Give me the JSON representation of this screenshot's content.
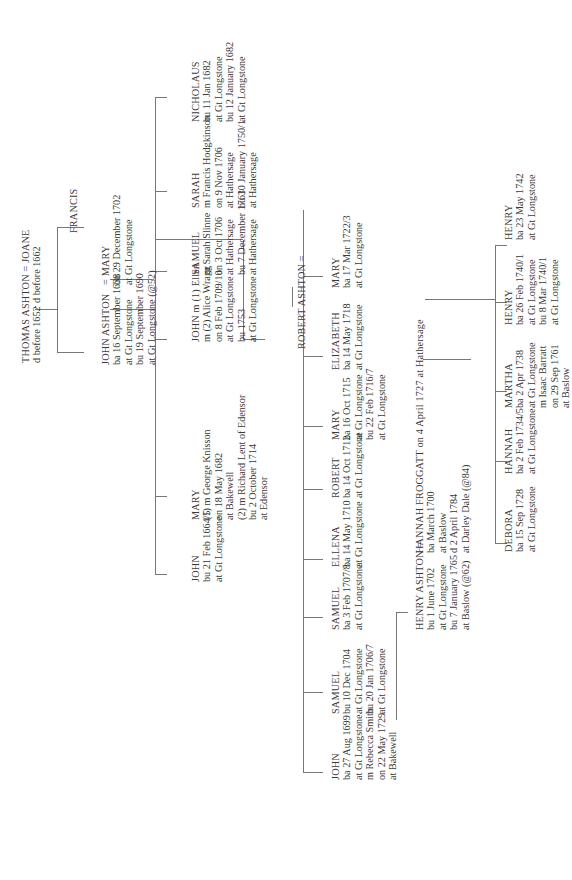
{
  "tree": {
    "gen1": {
      "couple": "THOMAS ASHTON = JOANE",
      "husband_details": [
        "d before 1652"
      ],
      "wife_details": [
        "d before 1662"
      ]
    },
    "gen2": [
      {
        "id": "john-ashton",
        "name": "JOHN ASHTON",
        "details": [
          "ba 16 September 1638",
          "at Gt Longstone",
          "bu 19 September 1690",
          "at Gt Longstone (@52)"
        ],
        "spouse_sep": "=",
        "spouse": "MARY",
        "spouse_details": [
          "bu 29 December 1702",
          "at Gt Longstone"
        ]
      },
      {
        "id": "francis",
        "name": "FRANCIS",
        "details": []
      }
    ],
    "gen3": [
      {
        "id": "mary",
        "name": "MARY",
        "details": [
          "(1) m George Knisson",
          "on 18 May 1682",
          "at Bakewell",
          "(2) m Richard Lent of Edensor",
          "bu 2 October 1714",
          "at Edensor"
        ]
      },
      {
        "id": "john-1664",
        "name": "JOHN",
        "details": [
          "bu 21 Feb 1664/5",
          "at Gt Longstone"
        ]
      },
      {
        "id": "john-m",
        "name": "JOHN m (1) Ellen",
        "details": [
          "m (2) Alice Wragg",
          "on 8 Feb 1709/10",
          "at Gt Longstone",
          "bu 1753",
          "at Gt Longstone"
        ]
      },
      {
        "id": "samuel",
        "name": "SAMUEL",
        "details": [
          "m Sarah Slinne",
          "on 3 Oct 1706",
          "at Hathersage",
          "bu 7 December 1761",
          "at Hathersage"
        ]
      },
      {
        "id": "sarah",
        "name": "SARAH",
        "details": [
          "m Francis Hodgkinson",
          "on 9 Nov 1706",
          "at Hathersage",
          "bu 30 January 1750/1",
          "at Hathersage"
        ]
      },
      {
        "id": "nicholaus",
        "name": "NICHOLAUS",
        "details": [
          "bu 11 Jan 1682",
          "at Gt Longstone",
          "bu 12 January 1682",
          "at Gt Longstone"
        ]
      }
    ],
    "robert": {
      "name": "ROBERT ASHTON ="
    },
    "gen4": [
      {
        "id": "john-1699",
        "name": "JOHN",
        "details": [
          "ba 27 Aug 1699",
          "at Gt Longstone",
          "m Rebecca Smith",
          "on 22 May 1729",
          "at Bakewell"
        ]
      },
      {
        "id": "samuel-1704",
        "name": "SAMUEL",
        "details": [
          "bu 10 Dec 1704",
          "at Gt Longstone",
          "bu 20 Jan 1706/7",
          "at Gt Longstone"
        ]
      },
      {
        "id": "samuel-1707",
        "name": "SAMUEL",
        "details": [
          "ba 3 Feb 1707/8",
          "at Gt Longstone"
        ]
      },
      {
        "id": "ellena",
        "name": "ELLENA",
        "details": [
          "ba 14 May 1710",
          "at Gt Longstone"
        ]
      },
      {
        "id": "robert",
        "name": "ROBERT",
        "details": [
          "ba 14 Oct 1712",
          "at Gt Longstone"
        ]
      },
      {
        "id": "mary-1715",
        "name": "MARY",
        "details": [
          "ba 16 Oct 1715",
          "at Gt Longstone",
          "bu 22 Feb 1716/7",
          "at Gt Longstone"
        ]
      },
      {
        "id": "elizabeth",
        "name": "ELIZABETH",
        "details": [
          "ba 14 May 1718",
          "at Gt Longstone"
        ]
      },
      {
        "id": "mary-1722",
        "name": "MARY",
        "details": [
          "ba 17 Mar 1722/3",
          "at Gt Longstone"
        ]
      }
    ],
    "henry_couple": {
      "husband": "HENRY ASHTON =",
      "husband_details": [
        "bu 1 June 1702",
        "at Gt Longstone",
        "bu 7 January 1765",
        "at Baslow (@62)"
      ],
      "wife": "HANNAH FROGGATT on 4 April 1727 at Hathersage",
      "wife_details": [
        "ba March 1700",
        "at Baslow",
        "d 2 April 1784",
        "at Darley Dale (@84)"
      ]
    },
    "gen5": [
      {
        "id": "debora",
        "name": "DEBORA",
        "details": [
          "ba 15 Sep 1728",
          "at Gt Longstone"
        ]
      },
      {
        "id": "hannah",
        "name": "HANNAH",
        "details": [
          "ba 2 Feb 1734/5",
          "at Gt Longstone"
        ]
      },
      {
        "id": "martha",
        "name": "MARTHA",
        "details": [
          "ba 2 Apr 1738",
          "at Gt Longstone",
          "m Isaac Barratt",
          "on 29 Sep 1761",
          "at Baslow"
        ]
      },
      {
        "id": "henry-1740",
        "name": "HENRY",
        "details": [
          "ba 26 Feb 1740/1",
          "at Gt Longstone",
          "bu 8 Mar 1740/1",
          "at Gt Longstone"
        ]
      },
      {
        "id": "henry-1742",
        "name": "HENRY",
        "details": [
          "ba 23 May 1742",
          "at Gt Longstone"
        ]
      }
    ]
  }
}
